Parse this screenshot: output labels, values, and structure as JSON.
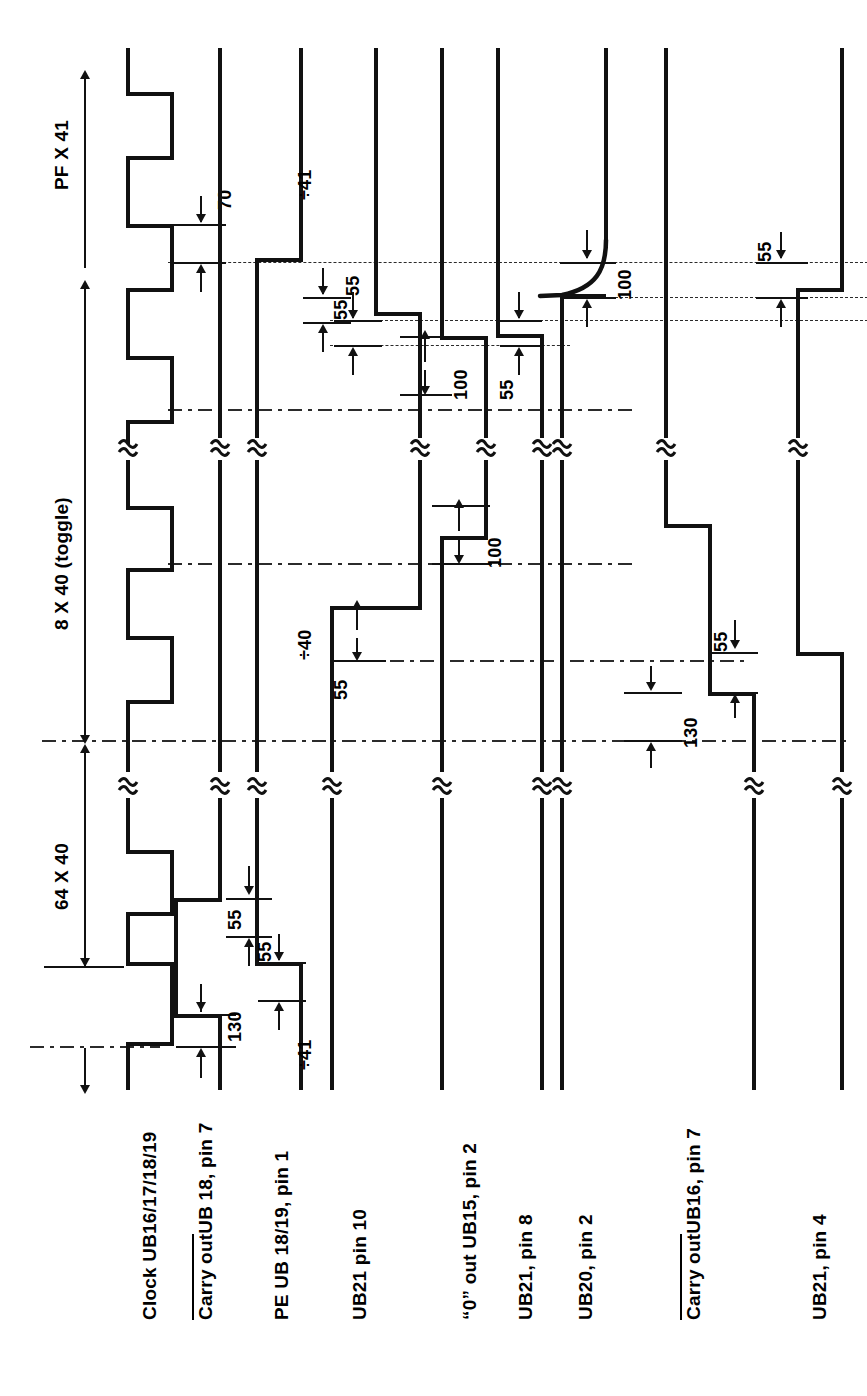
{
  "figure": {
    "type": "digital-timing-diagram",
    "orientation": "rotated-90-ccw",
    "time_unit": "ns",
    "background": "#ffffff",
    "ink": "#111111"
  },
  "axis_labels": {
    "top_span": "PF X 41",
    "top_span_plain": "PF X 41",
    "bottom_span": "PF X 41",
    "span_toggle": "8 X 40 (toggle)",
    "span_64": "64 X 40"
  },
  "signals": [
    {
      "id": "clock",
      "label": "Clock UB16/17/18/19",
      "overline": false
    },
    {
      "id": "carry7",
      "label": "UB 18, pin 7",
      "prefix": "Carry out",
      "overline": true
    },
    {
      "id": "pe",
      "label": "PE UB 18/19, pin 1",
      "overline": false
    },
    {
      "id": "ub21p10",
      "label": "UB21 pin 10",
      "overline": false
    },
    {
      "id": "zeroout",
      "label": "“0” out UB15, pin 2",
      "overline": false
    },
    {
      "id": "ub21p8",
      "label": "UB21, pin 8",
      "overline": false
    },
    {
      "id": "ub20p2",
      "label": "UB20, pin 2",
      "overline": false
    },
    {
      "id": "carry16",
      "label": "UB16, pin 7",
      "prefix": "Carry out",
      "overline": true
    },
    {
      "id": "ub21p4",
      "label": "UB21, pin 4",
      "overline": false
    }
  ],
  "divider_labels": [
    {
      "text": "÷41",
      "signal": "pe",
      "position": "top"
    },
    {
      "text": "÷40",
      "signal": "pe",
      "position": "middle"
    },
    {
      "text": "÷41",
      "signal": "pe",
      "position": "bottom"
    }
  ],
  "dimensions": [
    {
      "value": "70",
      "signal": "clock",
      "region": "top"
    },
    {
      "value": "55",
      "signal": "pe",
      "region": "top"
    },
    {
      "value": "55",
      "signal": "ub21p10",
      "region": "upper"
    },
    {
      "value": "100",
      "signal": "zeroout",
      "region": "upper"
    },
    {
      "value": "55",
      "signal": "ub21p8",
      "region": "upper"
    },
    {
      "value": "100",
      "signal": "ub20p2",
      "region": "upper"
    },
    {
      "value": "55",
      "signal": "carry16",
      "region": "upper"
    },
    {
      "value": "100",
      "signal": "zeroout",
      "region": "middle"
    },
    {
      "value": "55",
      "signal": "ub21p10",
      "region": "lower"
    },
    {
      "value": "55",
      "signal": "carry16",
      "region": "lower"
    },
    {
      "value": "130",
      "signal": "carry16",
      "region": "lower"
    },
    {
      "value": "130",
      "signal": "carry7",
      "region": "bottom"
    },
    {
      "value": "55",
      "signal": "pe",
      "region": "bottom"
    }
  ]
}
